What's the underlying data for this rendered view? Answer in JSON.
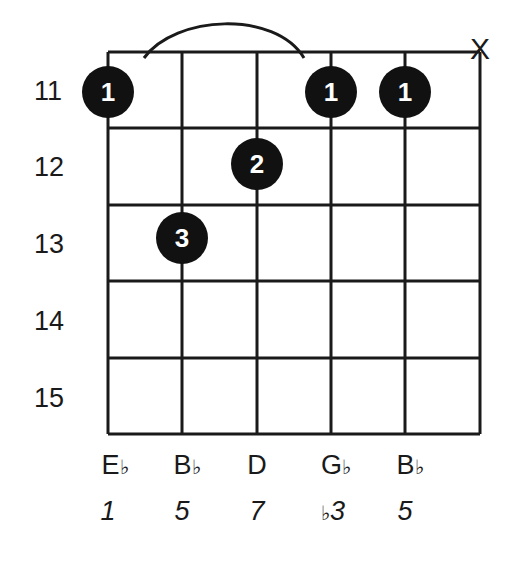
{
  "chord": {
    "root": "E♭",
    "muted_strings": [
      6
    ],
    "barre": {
      "fret": 11,
      "from_string": 1,
      "to_string": 4,
      "label": "1"
    },
    "fret_numbers": [
      "11",
      "12",
      "13",
      "14",
      "15"
    ],
    "strings_shown": 6,
    "dots": [
      {
        "string": 1,
        "fret": 11,
        "finger": "1"
      },
      {
        "string": 2,
        "fret": 13,
        "finger": "3"
      },
      {
        "string": 3,
        "fret": 12,
        "finger": "2"
      },
      {
        "string": 4,
        "fret": 11,
        "finger": "1"
      },
      {
        "string": 5,
        "fret": 11,
        "finger": "1"
      }
    ],
    "mute_symbol": "X",
    "notes": [
      {
        "name": "E",
        "accidental": "♭"
      },
      {
        "name": "B",
        "accidental": "♭"
      },
      {
        "name": "D",
        "accidental": ""
      },
      {
        "name": "G",
        "accidental": "♭"
      },
      {
        "name": "B",
        "accidental": "♭"
      }
    ],
    "degrees": [
      {
        "prefix": "",
        "value": "1"
      },
      {
        "prefix": "",
        "value": "5"
      },
      {
        "prefix": "",
        "value": "7"
      },
      {
        "prefix": "♭",
        "value": "3"
      },
      {
        "prefix": "",
        "value": "5"
      }
    ]
  },
  "colors": {
    "ink": "#111111",
    "background": "#ffffff",
    "dot_text": "#ffffff"
  }
}
